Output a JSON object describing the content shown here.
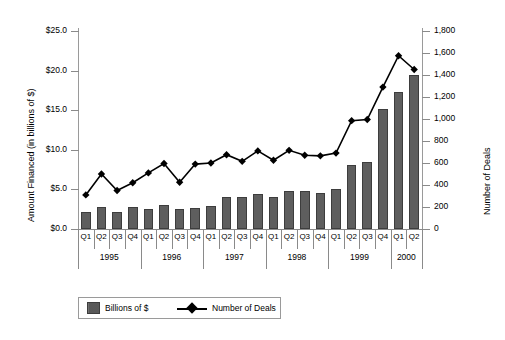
{
  "chart_data": {
    "type": "bar",
    "title": "",
    "xlabel": "",
    "ylabel": "Amount Financed (in billions of $)",
    "y2label": "Number of Deals",
    "categories": [
      "Q1",
      "Q2",
      "Q3",
      "Q4",
      "Q1",
      "Q2",
      "Q3",
      "Q4",
      "Q1",
      "Q2",
      "Q3",
      "Q4",
      "Q1",
      "Q2",
      "Q3",
      "Q4",
      "Q1",
      "Q2",
      "Q3",
      "Q4",
      "Q1",
      "Q2"
    ],
    "group_labels": [
      "1995",
      "1996",
      "1997",
      "1998",
      "1999",
      "2000"
    ],
    "group_sizes": [
      4,
      4,
      4,
      4,
      4,
      2
    ],
    "ylim": [
      0,
      25
    ],
    "y2lim": [
      0,
      1800
    ],
    "ytick_labels": [
      "$0.0",
      "$5.0",
      "$10.0",
      "$15.0",
      "$20.0",
      "$25.0"
    ],
    "ytick_values": [
      0,
      5,
      10,
      15,
      20,
      25
    ],
    "y2tick_labels": [
      "0",
      "200",
      "400",
      "600",
      "800",
      "1,000",
      "1,200",
      "1,400",
      "1,600",
      "1,800"
    ],
    "y2tick_values": [
      0,
      200,
      400,
      600,
      800,
      1000,
      1200,
      1400,
      1600,
      1800
    ],
    "grid": false,
    "legend_position": "bottom-left",
    "series": [
      {
        "name": "Billions of $",
        "kind": "bar",
        "axis": "left",
        "color": "#5e5e5e",
        "values": [
          2.1,
          2.8,
          2.1,
          2.8,
          2.5,
          3.0,
          2.5,
          2.7,
          2.9,
          4.1,
          4.0,
          4.4,
          4.1,
          4.8,
          4.8,
          4.6,
          5.0,
          8.1,
          8.5,
          15.2,
          17.3,
          19.4
        ]
      },
      {
        "name": "Number of Deals",
        "kind": "line",
        "axis": "right",
        "color": "#000000",
        "marker": "diamond",
        "values": [
          310,
          500,
          350,
          420,
          510,
          595,
          425,
          590,
          600,
          675,
          615,
          710,
          625,
          715,
          670,
          665,
          690,
          985,
          995,
          1290,
          1575,
          1450
        ]
      }
    ]
  },
  "legend": {
    "items": [
      {
        "label": "Billions of $",
        "marker": "bar-swatch"
      },
      {
        "label": "Number of Deals",
        "marker": "line-diamond"
      }
    ]
  }
}
